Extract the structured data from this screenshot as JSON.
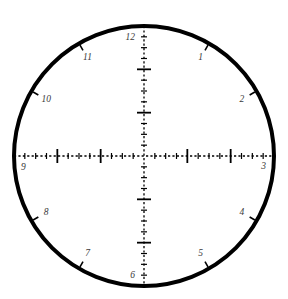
{
  "figure": {
    "type": "clock-face-dial",
    "title": "",
    "background_color": "#ffffff",
    "stroke_color": "#000000",
    "label_color": "#3a3a3a",
    "center": {
      "x": 144,
      "y": 156
    },
    "radius": 130,
    "rim_width": 4
  },
  "axes": {
    "vertical": {
      "label": "vertical-axis",
      "from_angle_deg": 90,
      "to_angle_deg": 270,
      "dashed": true
    },
    "horizontal": {
      "label": "horizontal-axis",
      "from_angle_deg": 180,
      "to_angle_deg": 0,
      "dashed": true
    }
  },
  "ticks": {
    "minor_count_per_axis_arm": 12,
    "minor_length": 3,
    "major_length": 7,
    "major_every": 4,
    "rim_tick_length": 6
  },
  "hours": [
    {
      "label": "12",
      "hour": 12,
      "angle_deg": 90,
      "label_side": "left"
    },
    {
      "label": "1",
      "hour": 1,
      "angle_deg": 60,
      "label_side": "left"
    },
    {
      "label": "2",
      "hour": 2,
      "angle_deg": 30,
      "label_side": "left"
    },
    {
      "label": "3",
      "hour": 3,
      "angle_deg": 0,
      "label_side": "left"
    },
    {
      "label": "4",
      "hour": 4,
      "angle_deg": -30,
      "label_side": "left"
    },
    {
      "label": "5",
      "hour": 5,
      "angle_deg": -60,
      "label_side": "left"
    },
    {
      "label": "6",
      "hour": 6,
      "angle_deg": -90,
      "label_side": "left"
    },
    {
      "label": "7",
      "hour": 7,
      "angle_deg": -120,
      "label_side": "right"
    },
    {
      "label": "8",
      "hour": 8,
      "angle_deg": -150,
      "label_side": "right"
    },
    {
      "label": "9",
      "hour": 9,
      "angle_deg": 180,
      "label_side": "right"
    },
    {
      "label": "10",
      "hour": 10,
      "angle_deg": 150,
      "label_side": "right"
    },
    {
      "label": "11",
      "hour": 11,
      "angle_deg": 120,
      "label_side": "right"
    }
  ],
  "watermark": {
    "text": "",
    "visible": false
  }
}
